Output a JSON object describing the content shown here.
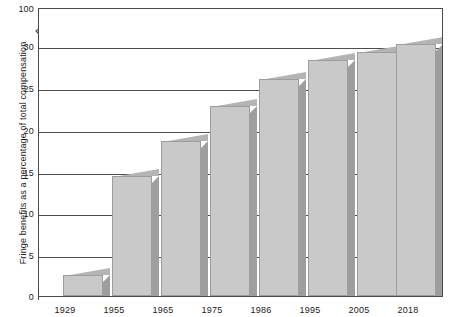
{
  "chart_data": {
    "type": "bar",
    "title": "",
    "subtitle": "",
    "xlabel": "",
    "ylabel": "Fringe benefits as a percentage of total compensation",
    "categories": [
      "1929",
      "1955",
      "1965",
      "1975",
      "1986",
      "1995",
      "2005",
      "2018"
    ],
    "values": [
      2.5,
      14.5,
      18.7,
      23.0,
      26.2,
      28.5,
      29.5,
      30.5
    ],
    "ylim": [
      0,
      100
    ],
    "yticks": [
      0,
      5,
      10,
      15,
      20,
      25,
      30,
      100
    ],
    "ytick_labels": [
      "0",
      "5",
      "10",
      "15",
      "20",
      "25",
      "30",
      "100"
    ],
    "axis_break": {
      "present": true,
      "between": [
        30,
        100
      ],
      "symbol": "zigzag"
    },
    "grid": true,
    "grid_axis": "y",
    "legend": null,
    "legend_position": "none",
    "bar_style": "3d-extruded",
    "colors": {
      "bar_face": "#c9c9c9",
      "bar_side": "#9e9e9e",
      "bar_top": "#b4b4b4",
      "bar_outline": "#9d9d9d",
      "gridline": "#4f4f4f",
      "frame": "#4a4a4a",
      "text": "#1b1b1b",
      "background": "#ffffff"
    }
  },
  "axis": {
    "y_title": "Fringe benefits as a percentage of total compensation",
    "break_symbol_name": "axis-break-zigzag"
  }
}
